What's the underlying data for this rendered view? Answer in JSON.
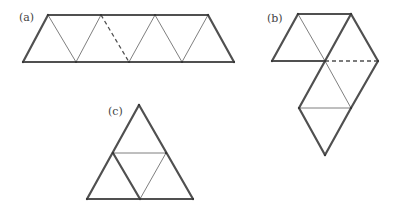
{
  "figure": {
    "colors": {
      "thick": "#505050",
      "thin": "#707070",
      "dashed": "#505050",
      "background": "#ffffff"
    }
  },
  "panels": [
    {
      "id": "a",
      "label": "(a)",
      "label_pos": [
        19,
        12
      ],
      "vertices": {
        "T1": [
          48,
          15
        ],
        "T2": [
          101,
          15
        ],
        "T3": [
          155,
          15
        ],
        "T4": [
          208,
          15
        ],
        "B1": [
          23,
          62
        ],
        "B2": [
          76,
          62
        ],
        "B3": [
          129,
          62
        ],
        "B4": [
          182,
          62
        ],
        "B5": [
          234,
          62
        ]
      },
      "edges": [
        {
          "from": "T1",
          "to": "T4",
          "style": "thick"
        },
        {
          "from": "B1",
          "to": "B5",
          "style": "thick"
        },
        {
          "from": "B1",
          "to": "T1",
          "style": "thick"
        },
        {
          "from": "T4",
          "to": "B5",
          "style": "thick"
        },
        {
          "from": "T1",
          "to": "B2",
          "style": "thin"
        },
        {
          "from": "B2",
          "to": "T2",
          "style": "thin"
        },
        {
          "from": "T2",
          "to": "B3",
          "style": "dashed"
        },
        {
          "from": "B3",
          "to": "T3",
          "style": "thin"
        },
        {
          "from": "T3",
          "to": "B4",
          "style": "thin"
        },
        {
          "from": "B4",
          "to": "T4",
          "style": "thin"
        }
      ]
    },
    {
      "id": "b",
      "label": "(b)",
      "label_pos": [
        267,
        13
      ],
      "vertices": {
        "TL": [
          298,
          14
        ],
        "TR": [
          351,
          14
        ],
        "L": [
          272,
          61
        ],
        "C": [
          325,
          61
        ],
        "R": [
          378,
          61
        ],
        "LL": [
          299,
          108
        ],
        "LR": [
          351,
          108
        ],
        "B": [
          325,
          155
        ]
      },
      "edges": [
        {
          "from": "TL",
          "to": "TR",
          "style": "thick"
        },
        {
          "from": "TL",
          "to": "L",
          "style": "thick"
        },
        {
          "from": "L",
          "to": "C",
          "style": "thick"
        },
        {
          "from": "TR",
          "to": "C",
          "style": "thick"
        },
        {
          "from": "TR",
          "to": "R",
          "style": "thick"
        },
        {
          "from": "R",
          "to": "LR",
          "style": "thick"
        },
        {
          "from": "C",
          "to": "LL",
          "style": "thick"
        },
        {
          "from": "LL",
          "to": "B",
          "style": "thick"
        },
        {
          "from": "B",
          "to": "LR",
          "style": "thick"
        },
        {
          "from": "TL",
          "to": "C",
          "style": "thin"
        },
        {
          "from": "C",
          "to": "LR",
          "style": "thin"
        },
        {
          "from": "LL",
          "to": "LR",
          "style": "thin"
        },
        {
          "from": "C",
          "to": "R",
          "style": "dashed"
        }
      ]
    },
    {
      "id": "c",
      "label": "(c)",
      "label_pos": [
        108,
        106
      ],
      "vertices": {
        "A": [
          139,
          105
        ],
        "ML": [
          113,
          153
        ],
        "MR": [
          166,
          153
        ],
        "BL": [
          87,
          199
        ],
        "BM": [
          140,
          199
        ],
        "BR": [
          193,
          199
        ]
      },
      "edges": [
        {
          "from": "A",
          "to": "BL",
          "style": "thick"
        },
        {
          "from": "A",
          "to": "BR",
          "style": "thick"
        },
        {
          "from": "BL",
          "to": "BR",
          "style": "thick"
        },
        {
          "from": "ML",
          "to": "BM",
          "style": "thick"
        },
        {
          "from": "ML",
          "to": "MR",
          "style": "thin"
        },
        {
          "from": "MR",
          "to": "BM",
          "style": "thin"
        }
      ]
    }
  ]
}
